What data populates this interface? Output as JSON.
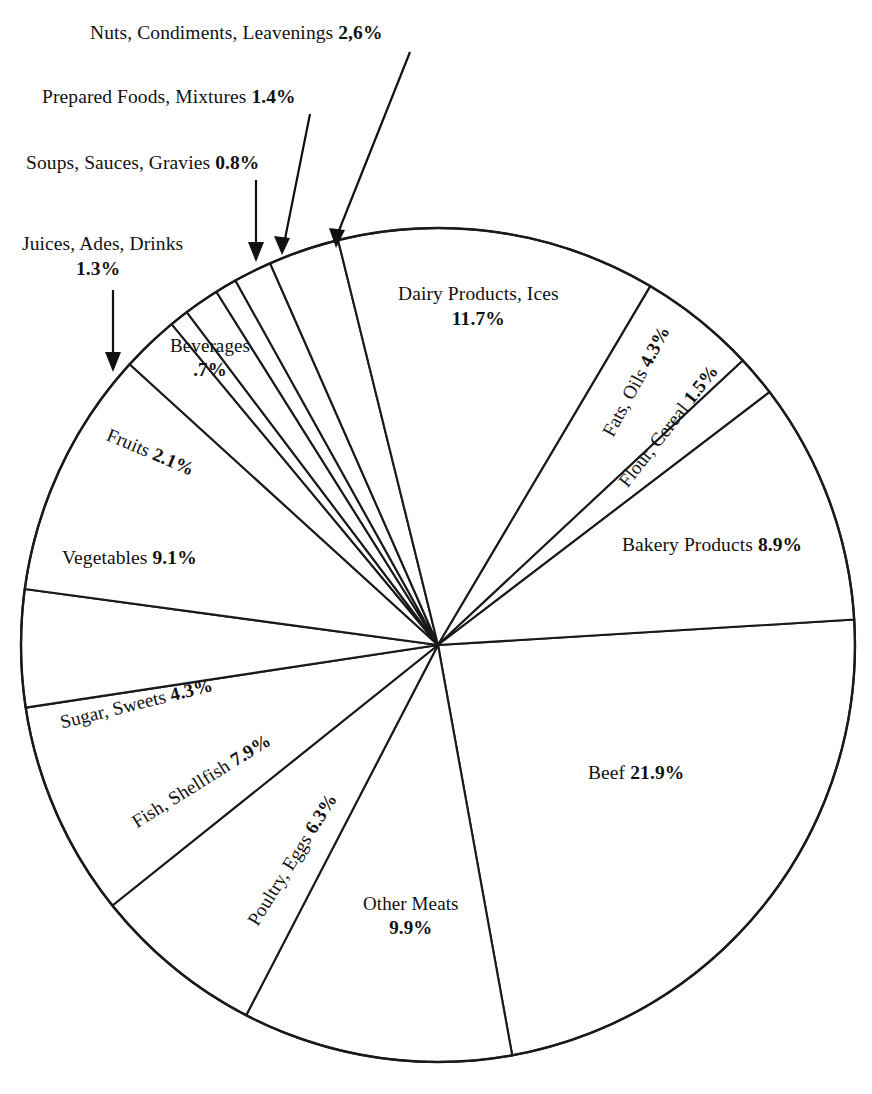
{
  "figure": {
    "title": "",
    "background_color": "#ffffff",
    "line_color": "#1a1a1a",
    "text_color": "#111111"
  },
  "chart_data": {
    "type": "pie",
    "title": "",
    "xlabel": "",
    "ylabel": "",
    "units": "percent",
    "legend_position": "none",
    "grid": false,
    "labels": [
      "Beef",
      "Other Meats",
      "Poultry, Eggs",
      "Fish, Shellfish",
      "Sugar, Sweets",
      "Vegetables",
      "Fruits",
      "Beverages",
      "Juices, Ades, Drinks",
      "Soups, Sauces, Gravies",
      "Prepared Foods, Mixtures",
      "Nuts, Condiments, Leavenings",
      "Dairy Products, Ices",
      "Fats, Oils",
      "Flour, Cereal",
      "Bakery Products"
    ],
    "values": [
      21.9,
      9.9,
      6.3,
      7.9,
      4.3,
      9.1,
      2.1,
      0.7,
      1.3,
      0.8,
      1.4,
      2.6,
      11.7,
      4.3,
      1.5,
      8.9
    ],
    "value_texts": [
      "21.9%",
      "9.9%",
      "6.3%",
      "7.9%",
      "4.3%",
      "9.1%",
      "2.1%",
      ".7%",
      "1.3%",
      "0.8%",
      "1.4%",
      "2,6%",
      "11.7%",
      "4.3%",
      "1.5%",
      "8.9%"
    ],
    "slices": [
      {
        "label": "Beef",
        "value": 21.9,
        "value_text": "21.9%",
        "label_placement": "inside"
      },
      {
        "label": "Other Meats",
        "value": 9.9,
        "value_text": "9.9%",
        "label_placement": "inside"
      },
      {
        "label": "Poultry, Eggs",
        "value": 6.3,
        "value_text": "6.3%",
        "label_placement": "inside-rotated"
      },
      {
        "label": "Fish, Shellfish",
        "value": 7.9,
        "value_text": "7.9%",
        "label_placement": "inside-rotated"
      },
      {
        "label": "Sugar, Sweets",
        "value": 4.3,
        "value_text": "4.3%",
        "label_placement": "inside-rotated"
      },
      {
        "label": "Vegetables",
        "value": 9.1,
        "value_text": "9.1%",
        "label_placement": "inside"
      },
      {
        "label": "Fruits",
        "value": 2.1,
        "value_text": "2.1%",
        "label_placement": "inside-rotated"
      },
      {
        "label": "Beverages",
        "value": 0.7,
        "value_text": ".7%",
        "label_placement": "inside"
      },
      {
        "label": "Juices, Ades, Drinks",
        "value": 1.3,
        "value_text": "1.3%",
        "label_placement": "callout"
      },
      {
        "label": "Soups, Sauces, Gravies",
        "value": 0.8,
        "value_text": "0.8%",
        "label_placement": "callout"
      },
      {
        "label": "Prepared Foods, Mixtures",
        "value": 1.4,
        "value_text": "1.4%",
        "label_placement": "callout"
      },
      {
        "label": "Nuts, Condiments, Leavenings",
        "value": 2.6,
        "value_text": "2,6%",
        "label_placement": "callout"
      },
      {
        "label": "Dairy Products, Ices",
        "value": 11.7,
        "value_text": "11.7%",
        "label_placement": "inside"
      },
      {
        "label": "Fats, Oils",
        "value": 4.3,
        "value_text": "4.3%",
        "label_placement": "inside-rotated"
      },
      {
        "label": "Flour, Cereal",
        "value": 1.5,
        "value_text": "1.5%",
        "label_placement": "inside-rotated"
      },
      {
        "label": "Bakery Products",
        "value": 8.9,
        "value_text": "8.9%",
        "label_placement": "inside"
      }
    ]
  },
  "labels": {
    "nuts": {
      "name": "Nuts, Condiments, Leavenings",
      "value": "2,6%"
    },
    "prepared": {
      "name": "Prepared Foods, Mixtures",
      "value": "1.4%"
    },
    "soups": {
      "name": "Soups, Sauces, Gravies",
      "value": "0.8%"
    },
    "juices": {
      "name": "Juices, Ades, Drinks",
      "value": "1.3%"
    },
    "beverages": {
      "name": "Beverages",
      "value": ".7%"
    },
    "fruits": {
      "name": "Fruits",
      "value": "2.1%"
    },
    "vegetables": {
      "name": "Vegetables",
      "value": "9.1%"
    },
    "sugar": {
      "name": "Sugar, Sweets",
      "value": "4.3%"
    },
    "fish": {
      "name": "Fish, Shellfish",
      "value": "7.9%"
    },
    "poultry": {
      "name": "Poultry, Eggs",
      "value": "6.3%"
    },
    "othermeats": {
      "name": "Other Meats",
      "value": "9.9%"
    },
    "beef": {
      "name": "Beef",
      "value": "21.9%"
    },
    "bakery": {
      "name": "Bakery Products",
      "value": "8.9%"
    },
    "flour": {
      "name": "Flour, Cereal",
      "value": "1.5%"
    },
    "fats": {
      "name": "Fats, Oils",
      "value": "4.3%"
    },
    "dairy": {
      "name": "Dairy Products, Ices",
      "value": "11.7%"
    }
  }
}
